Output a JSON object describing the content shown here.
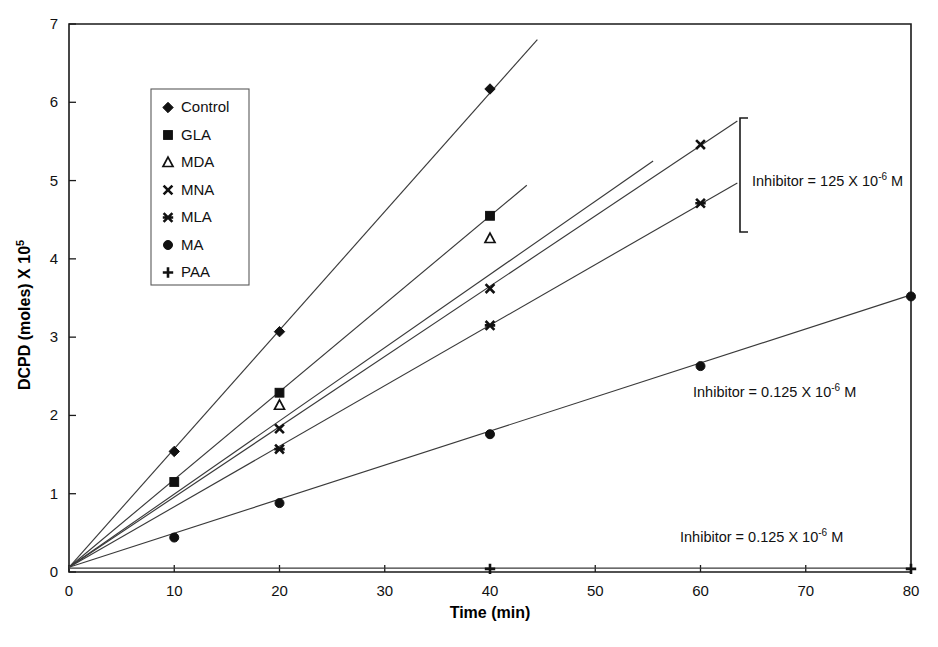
{
  "chart_data": {
    "type": "line",
    "title": "",
    "xlabel": "Time (min)",
    "ylabel": "DCPD (moles) X 10",
    "ylabel_exponent": "5",
    "xlim": [
      0,
      80
    ],
    "ylim": [
      0,
      7
    ],
    "xticks": [
      "0",
      "10",
      "20",
      "30",
      "40",
      "50",
      "60",
      "70",
      "80"
    ],
    "yticks": [
      "0",
      "1",
      "2",
      "3",
      "4",
      "5",
      "6",
      "7"
    ],
    "grid": false,
    "legend_position": "upper-left-inside",
    "series": [
      {
        "name": "Control",
        "marker": "diamond",
        "x": [
          0,
          10,
          20,
          40
        ],
        "values": [
          0.05,
          1.54,
          3.07,
          6.17
        ],
        "fit_start": [
          0,
          0.06
        ],
        "fit_end": [
          44.5,
          6.8
        ]
      },
      {
        "name": "GLA",
        "marker": "square",
        "x": [
          0,
          10,
          20,
          40
        ],
        "values": [
          0.05,
          1.15,
          2.29,
          4.55
        ],
        "fit_start": [
          0,
          0.06
        ],
        "fit_end": [
          43.5,
          4.94
        ]
      },
      {
        "name": "MDA",
        "marker": "triangle",
        "x": [
          0,
          20,
          40
        ],
        "values": [
          0.05,
          2.13,
          4.26
        ],
        "fit_start": [
          0,
          0.06
        ],
        "fit_end": [
          55.5,
          5.25
        ]
      },
      {
        "name": "MNA",
        "marker": "cross",
        "x": [
          0,
          20,
          40,
          60
        ],
        "values": [
          0.05,
          1.83,
          3.62,
          5.46
        ],
        "fit_start": [
          0,
          0.06
        ],
        "fit_end": [
          63.5,
          5.76
        ]
      },
      {
        "name": "MLA",
        "marker": "star",
        "x": [
          0,
          20,
          40,
          60
        ],
        "values": [
          0.05,
          1.57,
          3.15,
          4.71
        ],
        "fit_start": [
          0,
          0.06
        ],
        "fit_end": [
          63.5,
          4.97
        ]
      },
      {
        "name": "MA",
        "marker": "circle",
        "x": [
          0,
          10,
          20,
          40,
          60,
          80
        ],
        "values": [
          0.05,
          0.44,
          0.88,
          1.76,
          2.63,
          3.52
        ],
        "fit_start": [
          0,
          0.06
        ],
        "fit_end": [
          80,
          3.54
        ]
      },
      {
        "name": "PAA",
        "marker": "plus",
        "x": [
          0,
          40,
          80
        ],
        "values": [
          0.04,
          0.04,
          0.04
        ],
        "fit_start": [
          0,
          0.05
        ],
        "fit_end": [
          80,
          0.05
        ]
      }
    ],
    "annotations": [
      {
        "id": "annotation-inhibitor-125",
        "text_before": "Inhibitor = 125 X 10",
        "exponent": "-6",
        "text_after": " M",
        "x_px": 752,
        "y_px": 186,
        "bracket": true
      },
      {
        "id": "annotation-inhibitor-0125-upper",
        "text_before": "Inhibitor = 0.125 X 10",
        "exponent": "-6",
        "text_after": " M",
        "x_px": 693,
        "y_px": 397,
        "bracket": false
      },
      {
        "id": "annotation-inhibitor-0125-lower",
        "text_before": "Inhibitor = 0.125 X 10",
        "exponent": "-6",
        "text_after": " M",
        "x_px": 680,
        "y_px": 542,
        "bracket": false
      }
    ]
  },
  "legend": {
    "items": [
      {
        "label": "Control",
        "marker": "diamond"
      },
      {
        "label": "GLA",
        "marker": "square"
      },
      {
        "label": "MDA",
        "marker": "triangle"
      },
      {
        "label": "MNA",
        "marker": "cross"
      },
      {
        "label": "MLA",
        "marker": "star"
      },
      {
        "label": "MA",
        "marker": "circle"
      },
      {
        "label": "PAA",
        "marker": "plus"
      }
    ]
  },
  "colors": {
    "axis": "#1a1a1a",
    "series_line": "#3a3a3a",
    "marker": "#111111",
    "background": "#ffffff"
  }
}
